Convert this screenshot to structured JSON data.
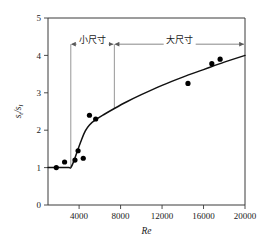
{
  "chart_data": {
    "type": "scatter",
    "title": "",
    "xlabel": "Re",
    "ylabel": "st/sl",
    "ylabel_parts": {
      "num": "s",
      "num_sub": "t",
      "den": "s",
      "den_sub": "l"
    },
    "xlim": [
      1000,
      20000
    ],
    "ylim": [
      0,
      5
    ],
    "xticks": [
      4000,
      8000,
      12000,
      16000,
      20000
    ],
    "xtick_labels": [
      "4000",
      "8000",
      "12000",
      "16000",
      "20000"
    ],
    "yticks": [
      0,
      1,
      2,
      3,
      4,
      5
    ],
    "ytick_labels": [
      "0",
      "1",
      "2",
      "3",
      "4",
      "5"
    ],
    "grid": false,
    "legend": false,
    "series": [
      {
        "name": "measured",
        "marker": "filled-circle",
        "color": "#000000",
        "points": [
          {
            "x": 1800,
            "y": 1.0
          },
          {
            "x": 2600,
            "y": 1.15
          },
          {
            "x": 3600,
            "y": 1.2
          },
          {
            "x": 3900,
            "y": 1.45
          },
          {
            "x": 4400,
            "y": 1.25
          },
          {
            "x": 5000,
            "y": 2.4
          },
          {
            "x": 5600,
            "y": 2.3
          },
          {
            "x": 14500,
            "y": 3.25
          },
          {
            "x": 16800,
            "y": 3.78
          },
          {
            "x": 17600,
            "y": 3.9
          }
        ]
      },
      {
        "name": "fitted-curve",
        "marker": "none",
        "color": "#111111",
        "points": [
          {
            "x": 1000,
            "y": 1.0
          },
          {
            "x": 2000,
            "y": 1.0
          },
          {
            "x": 3000,
            "y": 1.0
          },
          {
            "x": 3200,
            "y": 1.0
          },
          {
            "x": 3500,
            "y": 1.18
          },
          {
            "x": 3800,
            "y": 1.42
          },
          {
            "x": 4200,
            "y": 1.72
          },
          {
            "x": 4600,
            "y": 1.98
          },
          {
            "x": 5000,
            "y": 2.14
          },
          {
            "x": 5600,
            "y": 2.28
          },
          {
            "x": 6400,
            "y": 2.42
          },
          {
            "x": 7400,
            "y": 2.58
          },
          {
            "x": 8600,
            "y": 2.76
          },
          {
            "x": 10000,
            "y": 2.95
          },
          {
            "x": 12000,
            "y": 3.2
          },
          {
            "x": 14000,
            "y": 3.42
          },
          {
            "x": 16000,
            "y": 3.62
          },
          {
            "x": 18000,
            "y": 3.82
          },
          {
            "x": 20000,
            "y": 4.0
          }
        ]
      }
    ],
    "annotations": [
      {
        "name": "small-size-span",
        "label": "小尺寸",
        "x_start": 3200,
        "x_end": 7400,
        "y": 4.3,
        "arrows": "both"
      },
      {
        "name": "large-size-span",
        "label": "大尺寸",
        "x_start": 7400,
        "x_end": 20000,
        "y": 4.3,
        "arrows": "both"
      }
    ],
    "vertical_markers": [
      {
        "name": "transition-line-1",
        "x": 3200,
        "y_from": 1.0,
        "y_to": 4.3
      },
      {
        "name": "transition-line-2",
        "x": 7400,
        "y_from": 2.58,
        "y_to": 4.3
      }
    ]
  }
}
